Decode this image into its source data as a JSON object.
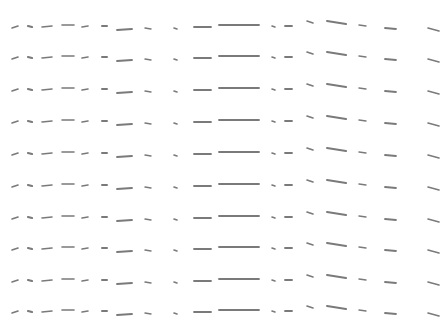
{
  "pattern": {
    "description": "Repeating rows of short gray dash strokes",
    "background": "#ffffff",
    "stroke_color": "#7a7a7a",
    "row_baselines": [
      27,
      58,
      90,
      122,
      154,
      186,
      218,
      249,
      281,
      312
    ],
    "strokes": [
      {
        "x1": 12,
        "y1": 1,
        "x2": 18,
        "y2": -1,
        "w": 1.6
      },
      {
        "x1": 28,
        "y1": -1,
        "x2": 32,
        "y2": 0,
        "w": 2.2
      },
      {
        "x1": 42,
        "y1": 0,
        "x2": 52,
        "y2": -1,
        "w": 1.6
      },
      {
        "x1": 62,
        "y1": -2,
        "x2": 74,
        "y2": -2,
        "w": 1.6
      },
      {
        "x1": 82,
        "y1": 0,
        "x2": 88,
        "y2": -1,
        "w": 1.6
      },
      {
        "x1": 102,
        "y1": -1,
        "x2": 107,
        "y2": -1,
        "w": 2.0
      },
      {
        "x1": 117,
        "y1": 3,
        "x2": 132,
        "y2": 2,
        "w": 1.8
      },
      {
        "x1": 145,
        "y1": 1,
        "x2": 151,
        "y2": 2,
        "w": 1.4
      },
      {
        "x1": 174,
        "y1": 1,
        "x2": 177,
        "y2": 2,
        "w": 1.6
      },
      {
        "x1": 194,
        "y1": 0,
        "x2": 211,
        "y2": 0,
        "w": 1.8
      },
      {
        "x1": 219,
        "y1": -2,
        "x2": 259,
        "y2": -2,
        "w": 1.8
      },
      {
        "x1": 272,
        "y1": -1,
        "x2": 275,
        "y2": 0,
        "w": 1.6
      },
      {
        "x1": 285,
        "y1": -1,
        "x2": 292,
        "y2": -1,
        "w": 1.8
      },
      {
        "x1": 307,
        "y1": -6,
        "x2": 313,
        "y2": -4,
        "w": 1.6
      },
      {
        "x1": 327,
        "y1": -6,
        "x2": 346,
        "y2": -3,
        "w": 2.0
      },
      {
        "x1": 359,
        "y1": -2,
        "x2": 366,
        "y2": -1,
        "w": 1.4
      },
      {
        "x1": 385,
        "y1": 1,
        "x2": 396,
        "y2": 2,
        "w": 1.8
      },
      {
        "x1": 428,
        "y1": 1,
        "x2": 439,
        "y2": 4,
        "w": 1.6
      }
    ]
  }
}
